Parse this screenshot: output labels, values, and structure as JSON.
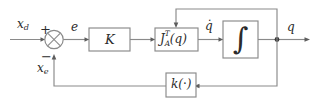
{
  "diagram": {
    "type": "control-block-diagram",
    "background_color": "#ffffff",
    "line_color": "#8a8a8a",
    "text_color": "#2b2b2b",
    "blocks": [
      {
        "id": "gain",
        "label": "K",
        "shape": "rectangle"
      },
      {
        "id": "jacobian",
        "label": "J",
        "superscript": "T",
        "subscript": "A",
        "argument": "(q)",
        "shape": "rectangle"
      },
      {
        "id": "integrator",
        "label": "∫",
        "shape": "rectangle"
      },
      {
        "id": "feedback",
        "label_prefix": "k(",
        "label_dot": "·",
        "label_suffix": ")",
        "shape": "rectangle"
      }
    ],
    "summing_junction": {
      "id": "sum",
      "shape": "circle-with-cross",
      "plus_sign": "+",
      "minus_sign": "−"
    },
    "signals": [
      {
        "id": "reference",
        "label_base": "x",
        "label_sub": "d",
        "position": "input-left"
      },
      {
        "id": "error",
        "label_base": "e",
        "label_sub": "",
        "position": "after-sum"
      },
      {
        "id": "joint_velocity",
        "label_base": "q̇",
        "label_sub": "",
        "position": "after-jacobian"
      },
      {
        "id": "joint_position",
        "label_base": "q",
        "label_sub": "",
        "position": "after-integrator"
      },
      {
        "id": "feedback_signal",
        "label_base": "x",
        "label_sub": "e",
        "position": "feedback-to-sum"
      }
    ]
  }
}
